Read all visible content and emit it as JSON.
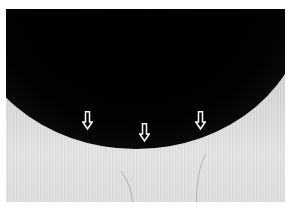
{
  "image": {
    "description": "Grayscale photo with a dark elliptical region fading into a lighter area, three hollow white arrows pointing down at the boundary",
    "colors": {
      "dark_region": "#000000",
      "light_region": "#d9d9d9",
      "arrow_fill": "#ffffff",
      "arrow_stroke": "#ffffff",
      "frame_background": "#ffffff"
    },
    "arrows": [
      {
        "name": "left",
        "x": 82,
        "y": 111,
        "direction": "down"
      },
      {
        "name": "center",
        "x": 139,
        "y": 123,
        "direction": "down"
      },
      {
        "name": "right",
        "x": 195,
        "y": 111,
        "direction": "down"
      }
    ]
  }
}
